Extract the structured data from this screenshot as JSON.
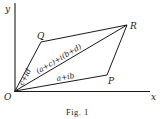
{
  "figure": {
    "caption": "Fig. 1",
    "axes": {
      "x_label": "x",
      "y_label": "y"
    },
    "points": {
      "O": {
        "label": "O",
        "x": 15,
        "y": 91
      },
      "P": {
        "label": "P",
        "x": 107,
        "y": 75
      },
      "Q": {
        "label": "Q",
        "x": 41,
        "y": 42
      },
      "R": {
        "label": "R",
        "x": 127,
        "y": 25
      }
    },
    "edge_labels": {
      "OQ": "c+id",
      "OR": "(a+c)+i(b+d)",
      "OP": "a+ib"
    },
    "segments": [
      {
        "from": "O",
        "to": "Q"
      },
      {
        "from": "Q",
        "to": "R"
      },
      {
        "from": "O",
        "to": "R"
      },
      {
        "from": "O",
        "to": "P"
      },
      {
        "from": "P",
        "to": "R"
      }
    ],
    "colors": {
      "ink": "#1a1a1a",
      "background": "#ffffff"
    }
  }
}
